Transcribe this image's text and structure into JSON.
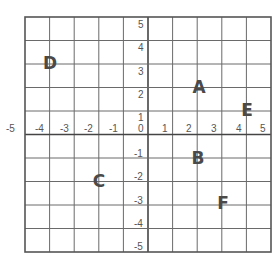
{
  "grid": {
    "x_range": [
      -5,
      5
    ],
    "y_range": [
      -5,
      5
    ],
    "line_color": "#6a6a6a",
    "border_color": "#555555",
    "axis_color": "#444444"
  },
  "x_ticks": [
    "-5",
    "-4",
    "-3",
    "-2",
    "-1",
    "0",
    "1",
    "2",
    "3",
    "4",
    "5"
  ],
  "y_ticks": [
    "5",
    "4",
    "3",
    "2",
    "1",
    "-1",
    "-2",
    "-3",
    "-4",
    "-5"
  ],
  "points": [
    {
      "label": "A",
      "x": 2.3,
      "y": 2.2
    },
    {
      "label": "B",
      "x": 2.3,
      "y": -1.1
    },
    {
      "label": "C",
      "x": -1.7,
      "y": -2.1
    },
    {
      "label": "D",
      "x": -3.8,
      "y": 3.2
    },
    {
      "label": "E",
      "x": 4.4,
      "y": 1.3
    },
    {
      "label": "F",
      "x": 3.4,
      "y": -3.1
    }
  ]
}
